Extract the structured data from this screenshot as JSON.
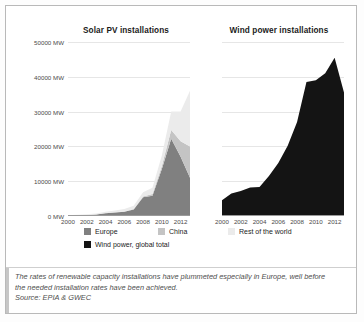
{
  "figure": {
    "caption_lines": [
      "The rates of renewable capacity installations have plummeted especially in Europe, well before",
      "the needed installation rates have been achieved."
    ],
    "source": "Source: EPIA & GWEC"
  },
  "legend": {
    "items": [
      {
        "label": "Europe",
        "color": "#808080"
      },
      {
        "label": "China",
        "color": "#c4c4c4"
      },
      {
        "label": "Rest of the world",
        "color": "#ebebeb"
      },
      {
        "label": "Wind power, global total",
        "color": "#141414"
      }
    ]
  },
  "chart_data": [
    {
      "type": "area",
      "id": "solar",
      "title": "Solar PV installations",
      "xlabel": "",
      "ylabel": "MW",
      "stacked": true,
      "grid": true,
      "legend_position": "bottom",
      "x": [
        2000,
        2001,
        2002,
        2003,
        2004,
        2005,
        2006,
        2007,
        2008,
        2009,
        2010,
        2011,
        2012,
        2013
      ],
      "xtick_labels": [
        "2000",
        "2002",
        "2004",
        "2006",
        "2008",
        "2010",
        "2012"
      ],
      "xticks": [
        2000,
        2002,
        2004,
        2006,
        2008,
        2010,
        2012
      ],
      "ytick_labels": [
        "0 MW",
        "10000 MW",
        "20000 MW",
        "30000 MW",
        "40000 MW",
        "50000 MW"
      ],
      "yticks": [
        0,
        10000,
        20000,
        30000,
        40000,
        50000
      ],
      "ylim": [
        0,
        50000
      ],
      "xlim": [
        2000,
        2013
      ],
      "series": [
        {
          "name": "Europe",
          "color": "#808080",
          "values": [
            130,
            200,
            280,
            420,
            800,
            1000,
            1200,
            1900,
            5400,
            5800,
            13500,
            22200,
            17000,
            11000
          ]
        },
        {
          "name": "China",
          "color": "#c4c4c4",
          "values": [
            0,
            0,
            10,
            20,
            30,
            50,
            80,
            120,
            200,
            500,
            900,
            2500,
            4500,
            9000
          ]
        },
        {
          "name": "Rest of the world",
          "color": "#ebebeb",
          "values": [
            120,
            150,
            200,
            280,
            400,
            500,
            700,
            900,
            1200,
            1800,
            3000,
            5300,
            8500,
            16000
          ]
        }
      ]
    },
    {
      "type": "area",
      "id": "wind",
      "title": "Wind power installations",
      "xlabel": "",
      "ylabel": "MW",
      "stacked": false,
      "grid": true,
      "legend_position": "bottom",
      "x": [
        2000,
        2001,
        2002,
        2003,
        2004,
        2005,
        2006,
        2007,
        2008,
        2009,
        2010,
        2011,
        2012,
        2013
      ],
      "xtick_labels": [
        "2000",
        "2002",
        "2004",
        "2006",
        "2008",
        "2010",
        "2012"
      ],
      "xticks": [
        2000,
        2002,
        2004,
        2006,
        2008,
        2010,
        2012
      ],
      "ytick_labels": [
        "0 MW",
        "10000 MW",
        "20000 MW",
        "30000 MW",
        "40000 MW",
        "50000 MW"
      ],
      "yticks": [
        0,
        10000,
        20000,
        30000,
        40000,
        50000
      ],
      "ylim": [
        0,
        50000
      ],
      "xlim": [
        2000,
        2013
      ],
      "series": [
        {
          "name": "Wind power, global total",
          "color": "#141414",
          "values": [
            4500,
            6500,
            7200,
            8200,
            8300,
            11500,
            15200,
            20200,
            27000,
            38500,
            39000,
            41000,
            45500,
            35500
          ]
        }
      ]
    }
  ]
}
